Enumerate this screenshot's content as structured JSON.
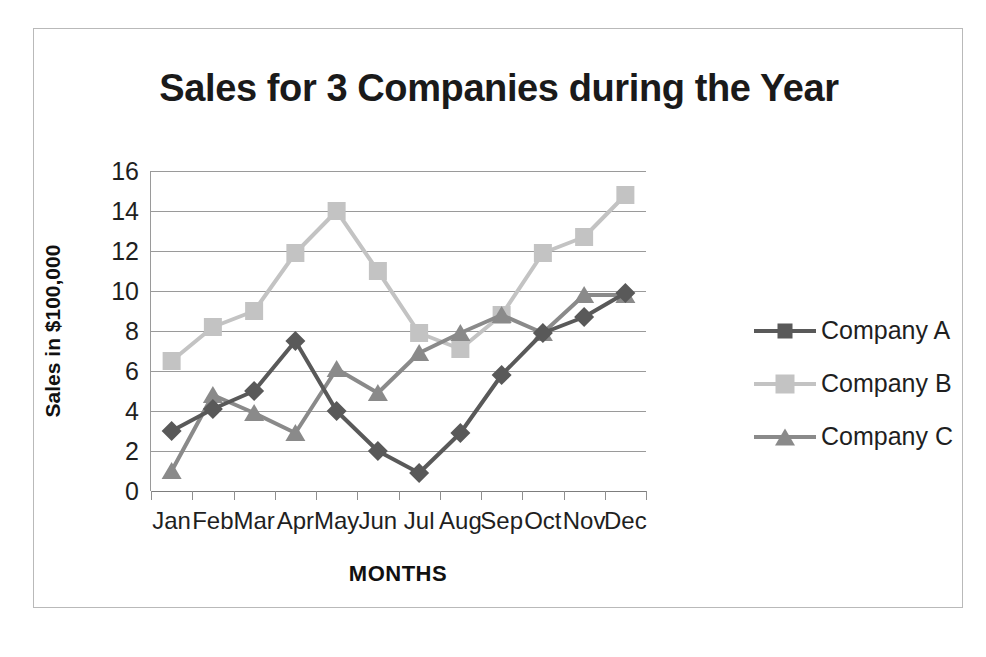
{
  "chart": {
    "title": "Sales for 3 Companies during the Year",
    "xlabel": "MONTHS",
    "ylabel": "Sales in $100,000"
  },
  "legend": {
    "items": [
      {
        "label": "Company A",
        "marker": "diamond-marker",
        "color": "#595959"
      },
      {
        "label": "Company B",
        "marker": "square-marker",
        "color": "#c3c3c3"
      },
      {
        "label": "Company C",
        "marker": "triangle-marker",
        "color": "#8a8a8a"
      }
    ]
  },
  "chart_data": {
    "type": "line",
    "title": "Sales for 3 Companies during the Year",
    "xlabel": "MONTHS",
    "ylabel": "Sales in $100,000",
    "categories": [
      "Jan",
      "Feb",
      "Mar",
      "Apr",
      "May",
      "Jun",
      "Jul",
      "Aug",
      "Sep",
      "Oct",
      "Nov",
      "Dec"
    ],
    "ytick_labels": [
      "0",
      "2",
      "4",
      "6",
      "8",
      "10",
      "12",
      "14",
      "16"
    ],
    "yticks": [
      0,
      2,
      4,
      6,
      8,
      10,
      12,
      14,
      16
    ],
    "ylim": [
      0,
      16
    ],
    "grid": true,
    "legend_position": "right",
    "series": [
      {
        "name": "Company A",
        "color": "#595959",
        "marker": "diamond",
        "values": [
          3.0,
          4.1,
          5.0,
          7.5,
          4.0,
          2.0,
          0.9,
          2.9,
          5.8,
          7.9,
          8.7,
          9.9
        ]
      },
      {
        "name": "Company B",
        "color": "#c3c3c3",
        "marker": "square",
        "values": [
          6.5,
          8.2,
          9.0,
          11.9,
          14.0,
          11.0,
          7.9,
          7.1,
          8.8,
          11.9,
          12.7,
          14.8
        ]
      },
      {
        "name": "Company C",
        "color": "#8a8a8a",
        "marker": "triangle",
        "values": [
          1.0,
          4.8,
          3.9,
          2.9,
          6.1,
          4.9,
          6.9,
          7.9,
          8.8,
          7.9,
          9.8,
          9.8
        ]
      }
    ]
  }
}
